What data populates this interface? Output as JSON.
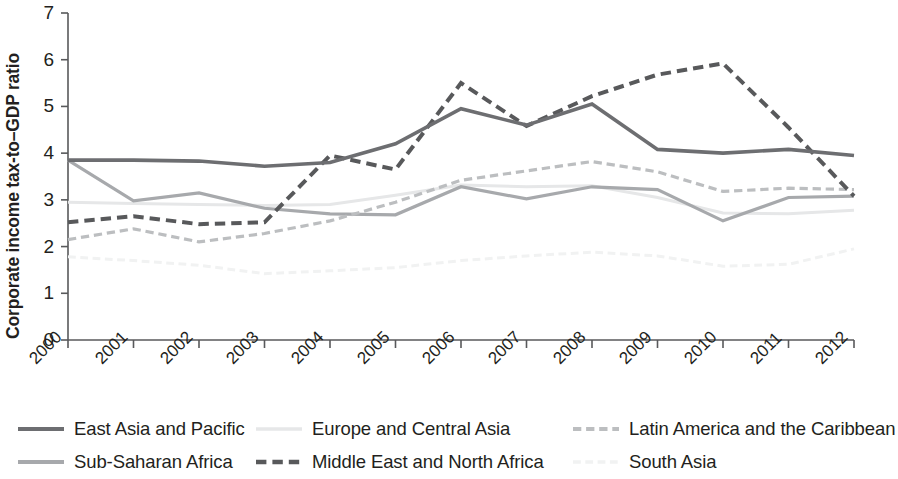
{
  "chart_data": {
    "type": "line",
    "title": "",
    "xlabel": "",
    "ylabel": "Corporate income tax-to–GDP ratio",
    "xlim": [
      2000,
      2012
    ],
    "ylim": [
      0,
      7
    ],
    "yticks": [
      "0",
      "1",
      "2",
      "3",
      "4",
      "5",
      "6",
      "7"
    ],
    "grid": false,
    "legend_position": "bottom",
    "categories": [
      "2000",
      "2001",
      "2002",
      "2003",
      "2004",
      "2005",
      "2006",
      "2007",
      "2008",
      "2009",
      "2010",
      "2011",
      "2012"
    ],
    "series": [
      {
        "name": "East Asia and Pacific",
        "color": "#6d6e71",
        "style": "solid",
        "width": 3.6,
        "values": [
          3.85,
          3.85,
          3.83,
          3.72,
          3.8,
          4.2,
          4.95,
          4.6,
          5.05,
          4.08,
          4.0,
          4.08,
          3.95
        ]
      },
      {
        "name": "Europe and Central Asia",
        "color": "#e6e7e8",
        "style": "solid",
        "width": 3.0,
        "values": [
          2.95,
          2.92,
          2.9,
          2.88,
          2.9,
          3.1,
          3.32,
          3.28,
          3.3,
          3.05,
          2.72,
          2.7,
          2.78
        ]
      },
      {
        "name": "Latin America and the Caribbean",
        "color": "#bcbec0",
        "style": "dashed",
        "width": 3.2,
        "values": [
          2.15,
          2.38,
          2.1,
          2.28,
          2.55,
          2.95,
          3.42,
          3.62,
          3.82,
          3.6,
          3.18,
          3.25,
          3.22
        ]
      },
      {
        "name": "Sub-Saharan Africa",
        "color": "#a7a9ac",
        "style": "solid",
        "width": 3.2,
        "values": [
          3.85,
          2.98,
          3.15,
          2.82,
          2.7,
          2.68,
          3.28,
          3.02,
          3.28,
          3.22,
          2.55,
          3.05,
          3.08
        ]
      },
      {
        "name": "Middle East and North Africa",
        "color": "#58595b",
        "style": "dashed",
        "width": 4.0,
        "values": [
          2.52,
          2.65,
          2.48,
          2.52,
          3.95,
          3.65,
          5.5,
          4.58,
          5.22,
          5.68,
          5.92,
          4.55,
          3.08
        ]
      },
      {
        "name": "South Asia",
        "color": "#f1f2f2",
        "style": "dashed",
        "width": 3.0,
        "values": [
          1.78,
          1.7,
          1.6,
          1.42,
          1.48,
          1.55,
          1.7,
          1.8,
          1.88,
          1.8,
          1.58,
          1.62,
          1.95
        ]
      }
    ]
  },
  "legend": {
    "rows": [
      [
        {
          "label": "East Asia and Pacific",
          "series": 0
        },
        {
          "label": "Europe and Central Asia",
          "series": 1
        },
        {
          "label": "Latin America and the Caribbean",
          "series": 2
        }
      ],
      [
        {
          "label": "Sub-Saharan Africa",
          "series": 3
        },
        {
          "label": "Middle East and North Africa",
          "series": 4
        },
        {
          "label": "South Asia",
          "series": 5
        }
      ]
    ]
  },
  "axes": {
    "y_axis_label": "Corporate income tax-to–GDP ratio"
  }
}
